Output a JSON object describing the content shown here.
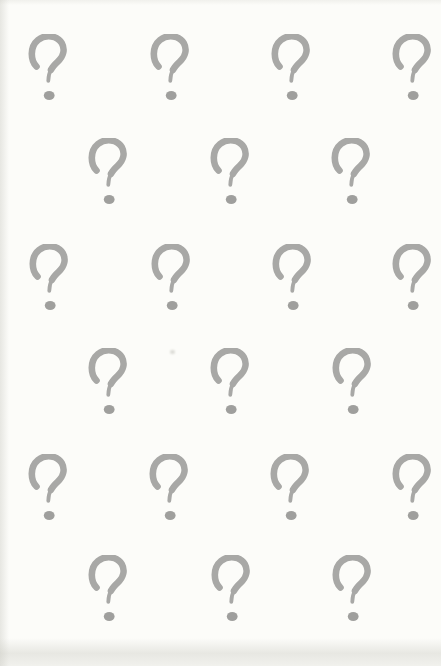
{
  "page": {
    "background_color": "#fcfcf9",
    "edge_shade_color": "#cbcbc3"
  },
  "pattern": {
    "glyph": "?",
    "glyph_name": "question-mark",
    "stroke_color": "#a4a4a2",
    "dot_color": "#9b9b99",
    "glyph_width": 44,
    "glyph_height": 70,
    "total_marks": 21,
    "rows": [
      {
        "y": 34,
        "x_centers": [
          48,
          170,
          291,
          412
        ]
      },
      {
        "y": 138,
        "x_centers": [
          108,
          230,
          351
        ]
      },
      {
        "y": 244,
        "x_centers": [
          49,
          171,
          292,
          412
        ]
      },
      {
        "y": 348,
        "x_centers": [
          108,
          230,
          352
        ]
      },
      {
        "y": 454,
        "x_centers": [
          48,
          169,
          290,
          412
        ]
      },
      {
        "y": 555,
        "x_centers": [
          108,
          231,
          352
        ]
      }
    ],
    "specks": [
      {
        "x": 172,
        "y": 352
      }
    ]
  }
}
